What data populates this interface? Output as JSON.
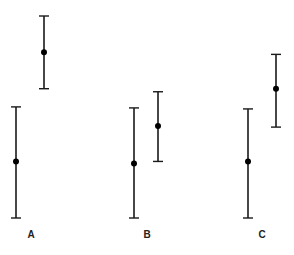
{
  "chart_data": {
    "type": "errorbar",
    "title": "",
    "xlabel": "",
    "ylabel": "",
    "axes_visible": false,
    "grid": false,
    "legend": "none",
    "ylim": [
      0,
      10
    ],
    "categories": [
      "A",
      "B",
      "C"
    ],
    "series": [
      {
        "name": "series-1",
        "points": [
          {
            "category": "A",
            "mean": 2.8,
            "low": 0.0,
            "high": 5.5
          },
          {
            "category": "B",
            "mean": 2.7,
            "low": 0.0,
            "high": 5.45
          },
          {
            "category": "C",
            "mean": 2.8,
            "low": 0.0,
            "high": 5.4
          }
        ]
      },
      {
        "name": "series-2",
        "points": [
          {
            "category": "A",
            "mean": 8.2,
            "low": 6.4,
            "high": 10.0
          },
          {
            "category": "B",
            "mean": 4.55,
            "low": 2.8,
            "high": 6.25
          },
          {
            "category": "C",
            "mean": 6.4,
            "low": 4.5,
            "high": 8.1
          }
        ]
      }
    ],
    "colors": {
      "line": "#1a1a1a",
      "marker": "#000000",
      "label": "#222222"
    }
  }
}
